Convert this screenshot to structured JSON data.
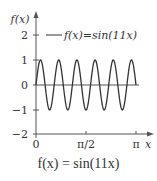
{
  "chart_data": {
    "type": "line",
    "title": "f(x) = sin(11x)",
    "xlabel": "x",
    "ylabel": "f(x)",
    "xlim": [
      0,
      3.14159
    ],
    "ylim": [
      -2,
      2
    ],
    "x_ticks": [
      "0",
      "π/2",
      "π"
    ],
    "y_ticks": [
      "2",
      "1",
      "0",
      "−1",
      "−2"
    ],
    "grid": false,
    "legend_position": "top",
    "series": [
      {
        "name": "f(x)=sin(11x)",
        "function": "sin(11x)",
        "frequency": 11,
        "amplitude": 1,
        "color": "#333333"
      }
    ]
  },
  "labels": {
    "ylabel": "f(x)",
    "xlabel": "x",
    "legend": "f(x)=sin(11x)",
    "caption": "f(x) = sin(11x)",
    "xtick_0": "0",
    "xtick_1": "π/2",
    "xtick_2": "π",
    "ytick_2": "2",
    "ytick_1": "1",
    "ytick_0": "0",
    "ytick_m1": "−1",
    "ytick_m2": "−2"
  },
  "colors": {
    "line": "#333333",
    "axis": "#555555",
    "text": "#333333"
  }
}
